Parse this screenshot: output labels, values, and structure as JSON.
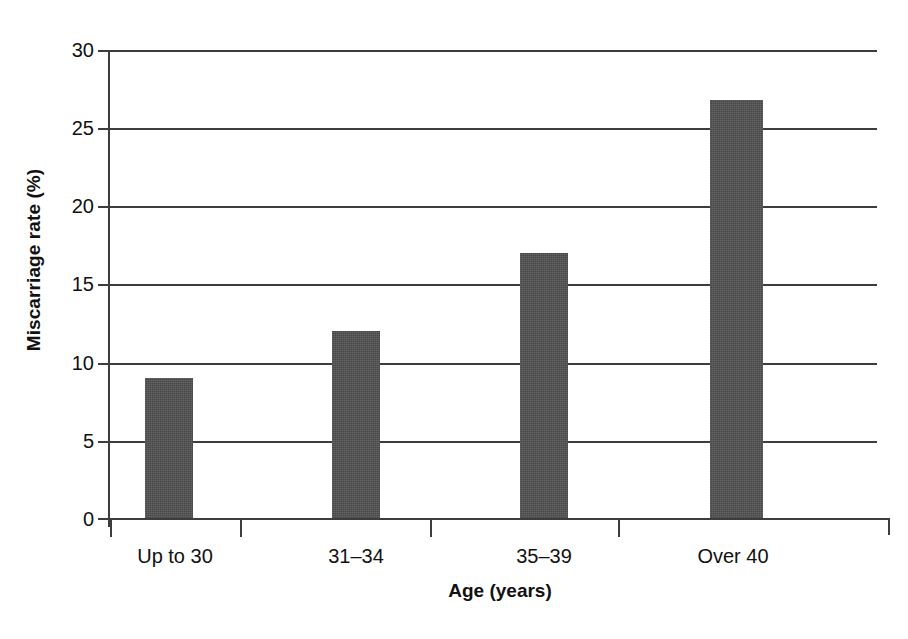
{
  "chart_data": {
    "type": "bar",
    "title": "",
    "subtitle": "",
    "xlabel": "Age (years)",
    "ylabel": "Miscarriage rate (%)",
    "categories": [
      "Up to 30",
      "31–34",
      "35–39",
      "Over 40"
    ],
    "values": [
      9,
      12,
      17,
      26.8
    ],
    "series": [
      {
        "name": "Miscarriage rate",
        "values": [
          9,
          12,
          17,
          26.8
        ]
      }
    ],
    "ylim": [
      0,
      30
    ],
    "xlim": [
      0,
      4
    ],
    "y_ticks": [
      0,
      5,
      10,
      15,
      20,
      25,
      30
    ],
    "y_tick_labels": [
      "0",
      "5",
      "10",
      "15",
      "20",
      "25",
      "30"
    ],
    "y_tick_interval": 5,
    "grid": "horizontal",
    "legend": "none",
    "legend_position": "none",
    "annotations": [],
    "bar_color": "#4e4e4e",
    "axis_color": "#3d3d3d",
    "background_color": "#ffffff"
  }
}
